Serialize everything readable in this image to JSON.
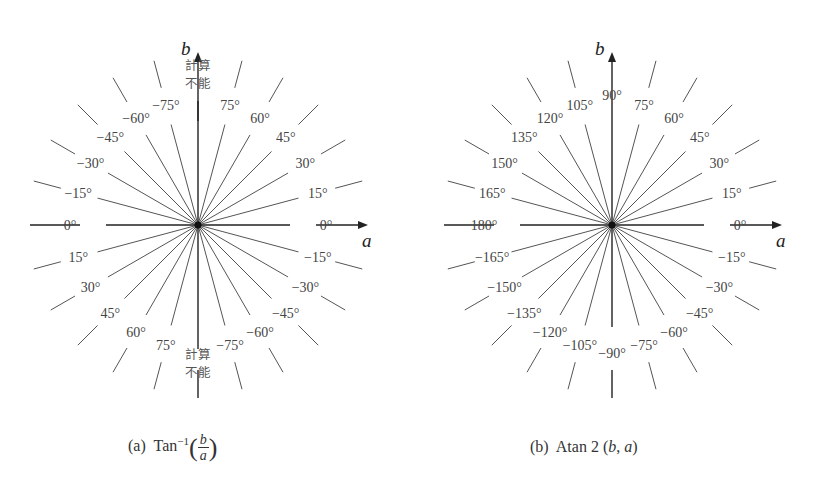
{
  "diagrams": [
    {
      "id": "a",
      "caption_prefix": "(a)",
      "caption_func": "Tan",
      "caption_sup": "−1",
      "caption_num": "b",
      "caption_den": "a",
      "x_axis_label": "a",
      "y_axis_label": "b",
      "undefined_label_line1": "計算",
      "undefined_label_line2": "不能",
      "ray_step_deg": 15,
      "labels": [
        {
          "angle": 0,
          "text": "0°"
        },
        {
          "angle": 15,
          "text": "15°"
        },
        {
          "angle": 30,
          "text": "30°"
        },
        {
          "angle": 45,
          "text": "45°"
        },
        {
          "angle": 60,
          "text": "60°"
        },
        {
          "angle": 75,
          "text": "75°"
        },
        {
          "angle": 105,
          "text": "−75°"
        },
        {
          "angle": 120,
          "text": "−60°"
        },
        {
          "angle": 135,
          "text": "−45°"
        },
        {
          "angle": 150,
          "text": "−30°"
        },
        {
          "angle": 165,
          "text": "−15°"
        },
        {
          "angle": 180,
          "text": "0°"
        },
        {
          "angle": 195,
          "text": "15°"
        },
        {
          "angle": 210,
          "text": "30°"
        },
        {
          "angle": 225,
          "text": "45°"
        },
        {
          "angle": 240,
          "text": "60°"
        },
        {
          "angle": 255,
          "text": "75°"
        },
        {
          "angle": 285,
          "text": "−75°"
        },
        {
          "angle": 300,
          "text": "−60°"
        },
        {
          "angle": 315,
          "text": "−45°"
        },
        {
          "angle": 330,
          "text": "−30°"
        },
        {
          "angle": 345,
          "text": "−15°"
        }
      ]
    },
    {
      "id": "b",
      "caption_prefix": "(b)",
      "caption_func": "Atan 2",
      "caption_args_b": "b",
      "caption_args_a": "a",
      "x_axis_label": "a",
      "y_axis_label": "b",
      "ray_step_deg": 15,
      "labels": [
        {
          "angle": 0,
          "text": "0°"
        },
        {
          "angle": 15,
          "text": "15°"
        },
        {
          "angle": 30,
          "text": "30°"
        },
        {
          "angle": 45,
          "text": "45°"
        },
        {
          "angle": 60,
          "text": "60°"
        },
        {
          "angle": 75,
          "text": "75°"
        },
        {
          "angle": 90,
          "text": "90°"
        },
        {
          "angle": 105,
          "text": "105°"
        },
        {
          "angle": 120,
          "text": "120°"
        },
        {
          "angle": 135,
          "text": "135°"
        },
        {
          "angle": 150,
          "text": "150°"
        },
        {
          "angle": 165,
          "text": "165°"
        },
        {
          "angle": 180,
          "text": "180°"
        },
        {
          "angle": 195,
          "text": "−165°"
        },
        {
          "angle": 210,
          "text": "−150°"
        },
        {
          "angle": 225,
          "text": "−135°"
        },
        {
          "angle": 240,
          "text": "−120°"
        },
        {
          "angle": 255,
          "text": "−105°"
        },
        {
          "angle": 270,
          "text": "−90°"
        },
        {
          "angle": 285,
          "text": "−75°"
        },
        {
          "angle": 300,
          "text": "−60°"
        },
        {
          "angle": 315,
          "text": "−45°"
        },
        {
          "angle": 330,
          "text": "−30°"
        },
        {
          "angle": 345,
          "text": "−15°"
        }
      ]
    }
  ]
}
